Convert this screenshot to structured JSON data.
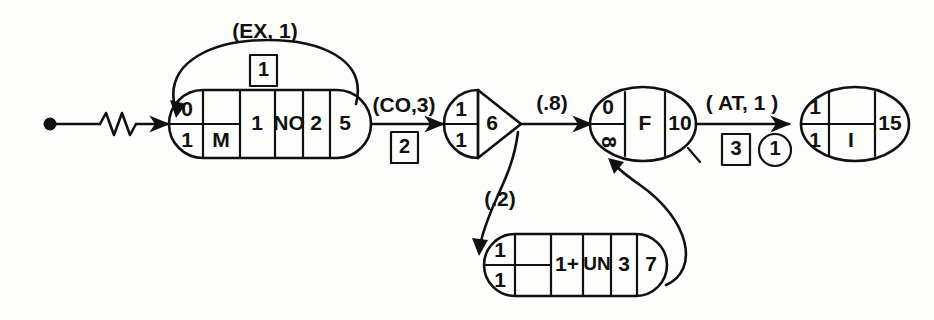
{
  "diagram": {
    "colors": {
      "ink": "#111111",
      "paper": "#fdfdfb"
    },
    "start": {
      "marker": "filled-dot",
      "squiggle": "resistor-zigzag"
    },
    "nodes": [
      {
        "id": "node-m",
        "shape": "stadium",
        "cells": {
          "top_left": "0",
          "bottom_left": "1",
          "bottom_second": "M",
          "c3": "1",
          "c4": "NO",
          "c5": "2",
          "c6": "5"
        }
      },
      {
        "id": "node-6",
        "shape": "half-circle-triangle",
        "cells": {
          "top_left": "1",
          "bottom_left": "1",
          "right": "6"
        }
      },
      {
        "id": "node-f",
        "shape": "ellipse",
        "cells": {
          "top_left": "0",
          "bottom_left": "8",
          "c2": "F",
          "c3": "10"
        }
      },
      {
        "id": "node-i",
        "shape": "ellipse",
        "cells": {
          "top_left": "1",
          "bottom_left": "1",
          "bottom_second": "I",
          "c3": "15"
        }
      },
      {
        "id": "node-un",
        "shape": "stadium",
        "cells": {
          "top_left": "1",
          "bottom_left": "1",
          "c3": "1+",
          "c4": "UN",
          "c5": "3",
          "c6": "7"
        }
      }
    ],
    "edges": [
      {
        "id": "edge-self-ex",
        "label": "(EX, 1)",
        "badge_box": "1",
        "from": "node-m",
        "to": "node-m",
        "kind": "self-loop"
      },
      {
        "id": "edge-co",
        "label": "(CO,3)",
        "badge_box": "2",
        "from": "node-m",
        "to": "node-6",
        "kind": "straight"
      },
      {
        "id": "edge-08",
        "label": "(.8)",
        "from": "node-6",
        "to": "node-f",
        "kind": "straight"
      },
      {
        "id": "edge-02",
        "label": "(.2)",
        "from": "node-6",
        "to": "node-un",
        "kind": "curve-down"
      },
      {
        "id": "edge-return",
        "label": "",
        "from": "node-un",
        "to": "node-f",
        "kind": "curve-up"
      },
      {
        "id": "edge-at",
        "label": "( AT, 1 )",
        "badge_box": "3",
        "badge_circle": "1",
        "from": "node-f",
        "to": "node-i",
        "kind": "straight"
      }
    ]
  }
}
